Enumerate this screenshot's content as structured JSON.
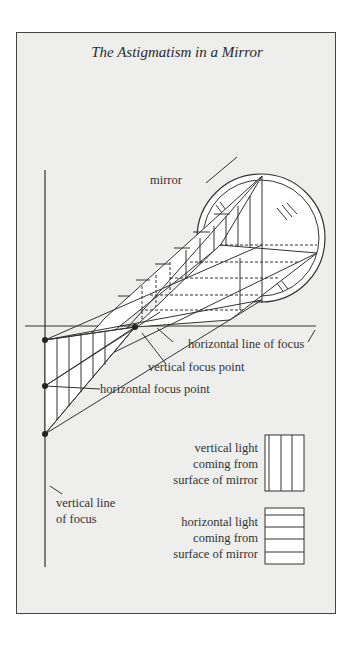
{
  "title": "The Astigmatism in a Mirror",
  "labels": {
    "mirror": "mirror",
    "horizontal_line_of_focus": "horizontal line of focus",
    "vertical_focus_point": "vertical focus point",
    "horizontal_focus_point": "horizontal focus point",
    "vertical_line_of_focus_1": "vertical line",
    "vertical_line_of_focus_2": "of focus"
  },
  "legend": [
    {
      "pattern": "vertical-lines",
      "lines": [
        "vertical light",
        "coming from",
        "surface of mirror"
      ]
    },
    {
      "pattern": "horizontal-lines",
      "lines": [
        "horizontal light",
        "coming from",
        "surface of mirror"
      ]
    }
  ],
  "colors": {
    "background": "#eeeeec",
    "ink": "#333333",
    "fill": "#ffffff"
  }
}
